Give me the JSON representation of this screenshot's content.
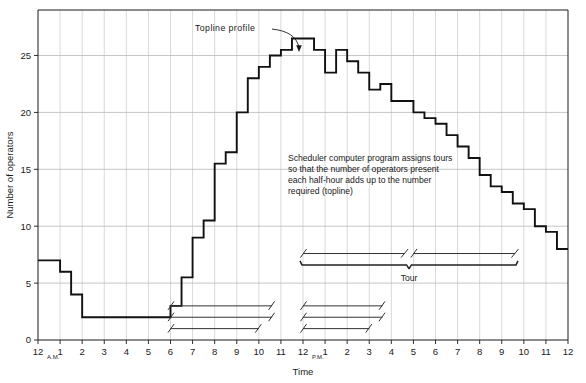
{
  "chart_data": {
    "type": "line",
    "subtype": "step",
    "title": "",
    "xlabel": "Time",
    "ylabel": "Number of operators",
    "ylim": [
      0,
      29
    ],
    "xlim": [
      0,
      24
    ],
    "grid": true,
    "legend_position": "none",
    "ytick_labels": [
      "0",
      "5",
      "10",
      "15",
      "20",
      "25"
    ],
    "ytick_values": [
      0,
      5,
      10,
      15,
      20,
      25
    ],
    "xtick_labels": [
      "12",
      "1",
      "2",
      "3",
      "4",
      "5",
      "6",
      "7",
      "8",
      "9",
      "10",
      "11",
      "12",
      "1",
      "2",
      "3",
      "4",
      "5",
      "6",
      "7",
      "8",
      "9",
      "10",
      "11",
      "12"
    ],
    "xtick_values": [
      0,
      1,
      2,
      3,
      4,
      5,
      6,
      7,
      8,
      9,
      10,
      11,
      12,
      13,
      14,
      15,
      16,
      17,
      18,
      19,
      20,
      21,
      22,
      23,
      24
    ],
    "xtick_suffix_am": "A.M.",
    "xtick_suffix_pm": "P.M.",
    "series_name": "Topline profile",
    "x": [
      0,
      0.5,
      1,
      1.5,
      2,
      2.5,
      3,
      3.5,
      4,
      4.5,
      5,
      5.5,
      6,
      6.5,
      7,
      7.5,
      8,
      8.5,
      9,
      9.5,
      10,
      10.5,
      11,
      11.5,
      12,
      12.5,
      13,
      13.5,
      14,
      14.5,
      15,
      15.5,
      16,
      16.5,
      17,
      17.5,
      18,
      18.5,
      19,
      19.5,
      20,
      20.5,
      21,
      21.5,
      22,
      22.5,
      23,
      23.5,
      24
    ],
    "values": [
      7,
      7,
      6,
      4,
      2,
      2,
      2,
      2,
      2,
      2,
      2,
      2,
      3,
      5.5,
      9,
      10.5,
      15.5,
      16.5,
      20,
      23,
      24,
      25,
      25.5,
      26.5,
      26.5,
      25.5,
      23.5,
      25.5,
      24.5,
      23.5,
      22,
      22.5,
      21,
      21,
      20,
      19.5,
      19,
      18,
      17,
      16,
      14.5,
      13.5,
      13,
      12,
      11.5,
      10,
      9.5,
      8,
      8
    ]
  },
  "callout": {
    "topline_label": "Topline profile"
  },
  "annotation": {
    "line1": "Scheduler computer program assigns tours",
    "line2": "so that the number of operators present",
    "line3": "each half-hour adds up to the number",
    "line4": "required (topline)"
  },
  "tour_bracket": {
    "label": "Tour",
    "segment1": {
      "start": 12.0,
      "end": 16.6
    },
    "segment2": {
      "start": 17.0,
      "end": 21.6
    }
  },
  "tour_bars": [
    {
      "row": 1,
      "start": 6.0,
      "end": 10.6,
      "y_value": 3.0
    },
    {
      "row": 2,
      "start": 6.0,
      "end": 10.6,
      "y_value": 2.0
    },
    {
      "row": 3,
      "start": 6.0,
      "end": 10.0,
      "y_value": 1.0
    },
    {
      "row": 4,
      "start": 12.0,
      "end": 15.6,
      "y_value": 3.0
    },
    {
      "row": 5,
      "start": 12.0,
      "end": 15.6,
      "y_value": 2.0
    },
    {
      "row": 6,
      "start": 12.0,
      "end": 15.0,
      "y_value": 1.0
    }
  ],
  "colors": {
    "curve": "#111111",
    "grid": "#c9c9c9",
    "axis": "#1a1a1a",
    "background": "#ffffff",
    "text": "#1a1a1a"
  }
}
